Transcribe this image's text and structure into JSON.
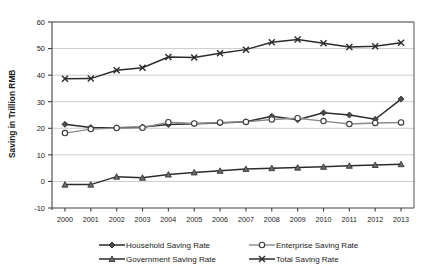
{
  "chart_data": {
    "type": "line",
    "title": "",
    "xlabel": "",
    "ylabel": "Saving in Trillion RMB",
    "categories": [
      "2000",
      "2001",
      "2002",
      "2003",
      "2004",
      "2005",
      "2006",
      "2007",
      "2008",
      "2009",
      "2010",
      "2011",
      "2012",
      "2013"
    ],
    "ylim": [
      -10,
      60
    ],
    "yticks": [
      -10,
      0,
      10,
      20,
      30,
      40,
      50,
      60
    ],
    "ytick_labels": [
      "-10",
      "0",
      "10",
      "20",
      "30",
      "40",
      "50",
      "60"
    ],
    "grid": true,
    "legend_position": "bottom",
    "series": [
      {
        "name": "Household Saving Rate",
        "marker": "diamond",
        "color": "#4a4a4a",
        "values": [
          21.5,
          20.3,
          20.2,
          20.5,
          21.4,
          21.7,
          22.0,
          22.5,
          24.5,
          23.2,
          25.8,
          25.0,
          23.4,
          31.0
        ]
      },
      {
        "name": "Enterprise Saving Rate",
        "marker": "circle",
        "color": "#8a8a8a",
        "values": [
          18.2,
          19.7,
          20.1,
          20.2,
          22.3,
          21.8,
          22.2,
          22.4,
          23.3,
          23.8,
          22.7,
          21.6,
          22.0,
          22.2
        ]
      },
      {
        "name": "Government Saving Rate",
        "marker": "triangle",
        "color": "#6a6a6a",
        "values": [
          -1.2,
          -1.2,
          1.8,
          1.4,
          2.6,
          3.4,
          4.0,
          4.7,
          5.0,
          5.2,
          5.5,
          5.9,
          6.2,
          6.5
        ]
      },
      {
        "name": "Total Saving Rate",
        "marker": "x",
        "color": "#2b2b2b",
        "values": [
          38.6,
          38.7,
          41.8,
          42.8,
          46.8,
          46.6,
          48.2,
          49.6,
          52.4,
          53.4,
          52.0,
          50.6,
          50.9,
          52.2
        ]
      }
    ]
  },
  "axis": {
    "y_title": "Saving in Trillion RMB"
  },
  "legend": {
    "items": [
      {
        "label": "Household Saving Rate",
        "marker": "diamond-marker-icon"
      },
      {
        "label": "Enterprise Saving Rate",
        "marker": "circle-marker-icon"
      },
      {
        "label": "Government Saving Rate",
        "marker": "triangle-marker-icon"
      },
      {
        "label": "Total Saving Rate",
        "marker": "x-marker-icon"
      }
    ]
  }
}
